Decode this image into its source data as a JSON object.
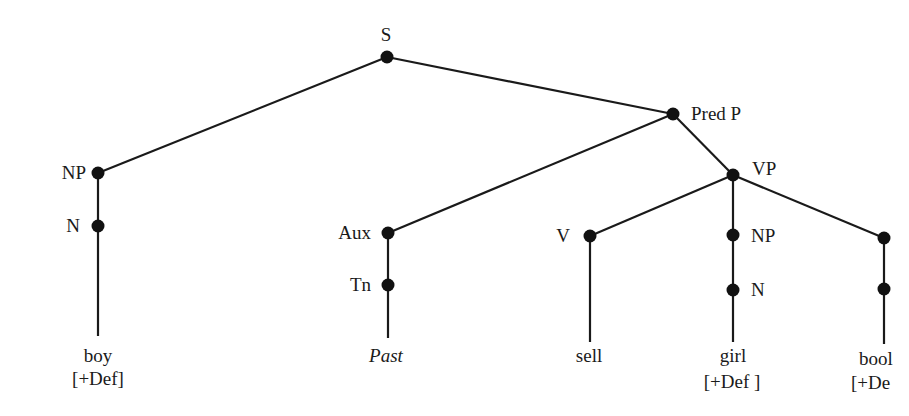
{
  "diagram": {
    "type": "syntax-tree",
    "nodes": {
      "s": {
        "label": "S"
      },
      "np_subject": {
        "label": "NP"
      },
      "n_subject": {
        "label": "N"
      },
      "pred_p": {
        "label": "Pred P"
      },
      "aux": {
        "label": "Aux"
      },
      "tn": {
        "label": "Tn"
      },
      "vp": {
        "label": "VP"
      },
      "v": {
        "label": "V"
      },
      "np_object": {
        "label": "NP"
      },
      "n_object": {
        "label": "N"
      }
    },
    "leaves": {
      "boy": {
        "word": "boy",
        "feature": "[+Def]"
      },
      "past": {
        "word": "Past"
      },
      "sell": {
        "word": "sell"
      },
      "girl": {
        "word": "girl",
        "feature": "[+Def ]"
      },
      "book": {
        "word": "bool",
        "feature": "[+De"
      }
    },
    "colors": {
      "line": "#1a1a1a",
      "node": "#111111",
      "background": "#ffffff"
    }
  }
}
